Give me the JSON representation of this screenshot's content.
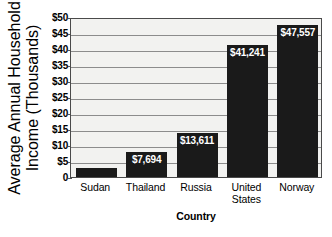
{
  "chart_data": {
    "type": "bar",
    "title": "",
    "xlabel": "Country",
    "ylabel": "Average Annual Household Income (Thousands)",
    "ylabel_line1": "Average Annual Household",
    "ylabel_line2": "Income (Thousands)",
    "categories": [
      "Sudan",
      "Thailand",
      "Russia",
      "United States",
      "Norway"
    ],
    "category_lines": [
      [
        "Sudan"
      ],
      [
        "Thailand"
      ],
      [
        "Russia"
      ],
      [
        "United",
        "States"
      ],
      [
        "Norway"
      ]
    ],
    "values": [
      2700,
      7694,
      13611,
      41241,
      47557
    ],
    "value_labels": [
      "$2,700",
      "$7,694",
      "$13,611",
      "$41,241",
      "$47,557"
    ],
    "value_label_position": [
      "outside-left",
      "inside-top",
      "inside-top",
      "inside-top",
      "inside-top"
    ],
    "ylim": [
      0,
      50000
    ],
    "ytick_values": [
      50000,
      45000,
      40000,
      35000,
      30000,
      25000,
      20000,
      15000,
      10000,
      5000,
      0
    ],
    "ytick_labels": [
      "$50",
      "$45",
      "$40",
      "$35",
      "$30",
      "$25",
      "$20",
      "$15",
      "$10",
      "$5",
      "0"
    ],
    "grid": true,
    "legend": "none",
    "bar_color": "#1a1a1a",
    "plot_background": "#f2f2f0",
    "gridline_color": "#8c8c8c",
    "axis_color": "#4a4a4a"
  }
}
